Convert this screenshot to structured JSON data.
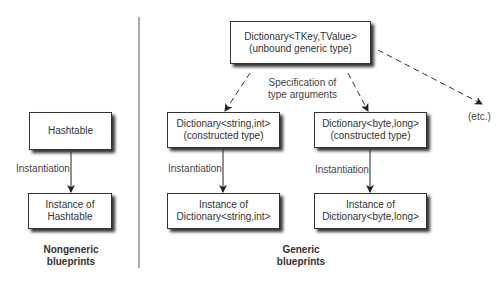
{
  "nongeneric": {
    "class_box": {
      "line1": "Hashtable"
    },
    "edge_label": "Instantiation",
    "instance_box": {
      "line1": "Instance of",
      "line2": "Hashtable"
    },
    "caption": {
      "line1": "Nongeneric",
      "line2": "blueprints"
    }
  },
  "generic": {
    "unbound_box": {
      "line1": "Dictionary<TKey,TValue>",
      "line2": "(unbound generic type)"
    },
    "spec_label": {
      "line1": "Specification of",
      "line2": "type arguments"
    },
    "etc_label": "(etc.)",
    "constructed_left": {
      "line1": "Dictionary<string,int>",
      "line2": "(constructed type)"
    },
    "constructed_right": {
      "line1": "Dictionary<byte,long>",
      "line2": "(constructed type)"
    },
    "edge_label_left": "Instantiation",
    "edge_label_right": "Instantiation",
    "instance_left": {
      "line1": "Instance of",
      "line2": "Dictionary<string,int>"
    },
    "instance_right": {
      "line1": "Instance of",
      "line2": "Dictionary<byte,long>"
    },
    "caption": {
      "line1": "Generic",
      "line2": "blueprints"
    }
  }
}
